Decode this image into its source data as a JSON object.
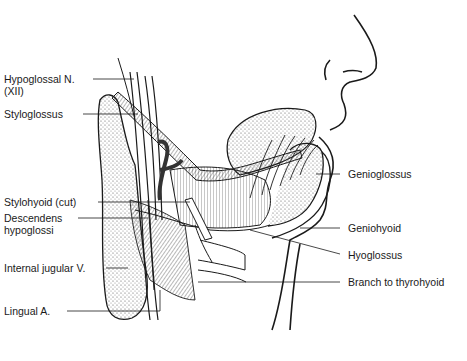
{
  "diagram": {
    "labels": {
      "hypoglossal_n": {
        "line1": "Hypoglossal N.",
        "line2": "(XII)"
      },
      "styloglossus": "Styloglossus",
      "stylohyoid_cut": "Stylohyoid (cut)",
      "descendens_hypoglossi": {
        "line1": "Descendens",
        "line2": "hypoglossi"
      },
      "internal_jugular_v": "Internal jugular V.",
      "lingual_a": "Lingual A.",
      "genioglossus": "Genioglossus",
      "geniohyoid": "Geniohyoid",
      "hyoglossus": "Hyoglossus",
      "branch_to_thyrohyoid": "Branch to thyrohyoid"
    },
    "colors": {
      "ink": "#1a1a1a",
      "background": "#ffffff",
      "stipple": "#555555"
    }
  }
}
